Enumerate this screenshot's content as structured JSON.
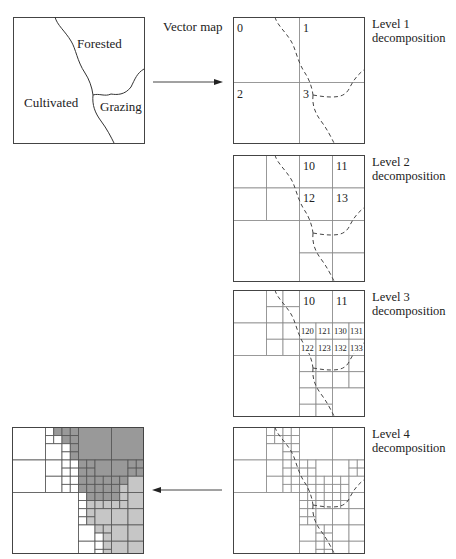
{
  "vector_map": {
    "caption": "Vector map",
    "regions": [
      {
        "name": "Forested",
        "x": 77,
        "y": 36
      },
      {
        "name": "Cultivated",
        "x": 24,
        "y": 95
      },
      {
        "name": "Grazing",
        "x": 100,
        "y": 99
      }
    ]
  },
  "levels": [
    {
      "caption_line1": "Level 1",
      "caption_line2": "decomposition",
      "quadrant_labels": [
        {
          "text": "0",
          "x": 4,
          "y": 4
        },
        {
          "text": "1",
          "x": 70,
          "y": 4
        },
        {
          "text": "2",
          "x": 4,
          "y": 70
        },
        {
          "text": "3",
          "x": 70,
          "y": 70
        }
      ]
    },
    {
      "caption_line1": "Level 2",
      "caption_line2": "decomposition",
      "quadrant_labels": [
        {
          "text": "10",
          "x": 70,
          "y": 4
        },
        {
          "text": "11",
          "x": 103,
          "y": 4
        },
        {
          "text": "12",
          "x": 70,
          "y": 36
        },
        {
          "text": "13",
          "x": 103,
          "y": 36
        }
      ]
    },
    {
      "caption_line1": "Level 3",
      "caption_line2": "decomposition",
      "quadrant_labels": [
        {
          "text": "10",
          "x": 70,
          "y": 4,
          "size": 12
        },
        {
          "text": "11",
          "x": 103,
          "y": 4,
          "size": 12
        },
        {
          "text": "120",
          "x": 68,
          "y": 36,
          "size": 8.5
        },
        {
          "text": "121",
          "x": 85,
          "y": 36,
          "size": 8.5
        },
        {
          "text": "130",
          "x": 101,
          "y": 36,
          "size": 8.5
        },
        {
          "text": "131",
          "x": 117,
          "y": 36,
          "size": 8.5
        },
        {
          "text": "122",
          "x": 68,
          "y": 53,
          "size": 8.5
        },
        {
          "text": "123",
          "x": 85,
          "y": 53,
          "size": 8.5
        },
        {
          "text": "132",
          "x": 101,
          "y": 53,
          "size": 8.5
        },
        {
          "text": "133",
          "x": 117,
          "y": 53,
          "size": 8.5
        }
      ]
    },
    {
      "caption_line1": "Level 4",
      "caption_line2": "decomposition",
      "quadrant_labels": []
    }
  ],
  "grids": {
    "level1": [
      [
        0,
        0,
        8
      ],
      [
        8,
        0,
        8
      ],
      [
        0,
        8,
        8
      ],
      [
        8,
        8,
        8
      ]
    ],
    "level2": [
      [
        0,
        0,
        4
      ],
      [
        4,
        0,
        4
      ],
      [
        0,
        4,
        4
      ],
      [
        4,
        4,
        4
      ],
      [
        8,
        0,
        4
      ],
      [
        12,
        0,
        4
      ],
      [
        8,
        4,
        4
      ],
      [
        12,
        4,
        4
      ],
      [
        0,
        8,
        8
      ],
      [
        8,
        8,
        4
      ],
      [
        12,
        8,
        4
      ],
      [
        8,
        12,
        4
      ],
      [
        12,
        12,
        4
      ]
    ],
    "level3": [
      [
        0,
        0,
        4
      ],
      [
        4,
        0,
        2
      ],
      [
        6,
        0,
        2
      ],
      [
        4,
        2,
        2
      ],
      [
        6,
        2,
        2
      ],
      [
        0,
        4,
        4
      ],
      [
        4,
        4,
        2
      ],
      [
        6,
        4,
        2
      ],
      [
        4,
        6,
        2
      ],
      [
        6,
        6,
        2
      ],
      [
        8,
        0,
        4
      ],
      [
        12,
        0,
        4
      ],
      [
        8,
        4,
        2
      ],
      [
        10,
        4,
        2
      ],
      [
        12,
        4,
        2
      ],
      [
        14,
        4,
        2
      ],
      [
        8,
        6,
        2
      ],
      [
        10,
        6,
        2
      ],
      [
        12,
        6,
        2
      ],
      [
        14,
        6,
        2
      ],
      [
        0,
        8,
        8
      ],
      [
        8,
        8,
        2
      ],
      [
        10,
        8,
        2
      ],
      [
        8,
        10,
        2
      ],
      [
        10,
        10,
        2
      ],
      [
        12,
        8,
        2
      ],
      [
        14,
        8,
        2
      ],
      [
        12,
        10,
        2
      ],
      [
        14,
        10,
        2
      ],
      [
        8,
        12,
        2
      ],
      [
        10,
        12,
        2
      ],
      [
        8,
        14,
        2
      ],
      [
        10,
        14,
        2
      ],
      [
        12,
        12,
        4
      ]
    ],
    "level4": [
      [
        0,
        0,
        4
      ],
      [
        4,
        0,
        1
      ],
      [
        5,
        0,
        1
      ],
      [
        4,
        1,
        1
      ],
      [
        5,
        1,
        1
      ],
      [
        6,
        0,
        1
      ],
      [
        7,
        0,
        1
      ],
      [
        6,
        1,
        1
      ],
      [
        7,
        1,
        1
      ],
      [
        4,
        2,
        2
      ],
      [
        6,
        2,
        1
      ],
      [
        7,
        2,
        1
      ],
      [
        6,
        3,
        1
      ],
      [
        7,
        3,
        1
      ],
      [
        0,
        4,
        4
      ],
      [
        4,
        4,
        2
      ],
      [
        6,
        4,
        1
      ],
      [
        7,
        4,
        1
      ],
      [
        6,
        5,
        1
      ],
      [
        7,
        5,
        1
      ],
      [
        4,
        6,
        2
      ],
      [
        6,
        6,
        1
      ],
      [
        7,
        6,
        1
      ],
      [
        6,
        7,
        1
      ],
      [
        7,
        7,
        1
      ],
      [
        8,
        0,
        4
      ],
      [
        12,
        0,
        4
      ],
      [
        8,
        4,
        1
      ],
      [
        9,
        4,
        1
      ],
      [
        8,
        5,
        1
      ],
      [
        9,
        5,
        1
      ],
      [
        10,
        4,
        2
      ],
      [
        12,
        4,
        2
      ],
      [
        14,
        4,
        1
      ],
      [
        15,
        4,
        1
      ],
      [
        14,
        5,
        1
      ],
      [
        15,
        5,
        1
      ],
      [
        8,
        6,
        1
      ],
      [
        9,
        6,
        1
      ],
      [
        8,
        7,
        1
      ],
      [
        9,
        7,
        1
      ],
      [
        10,
        6,
        1
      ],
      [
        11,
        6,
        1
      ],
      [
        10,
        7,
        1
      ],
      [
        11,
        7,
        1
      ],
      [
        12,
        6,
        1
      ],
      [
        13,
        6,
        1
      ],
      [
        12,
        7,
        1
      ],
      [
        13,
        7,
        1
      ],
      [
        14,
        6,
        2
      ],
      [
        0,
        8,
        8
      ],
      [
        8,
        8,
        1
      ],
      [
        9,
        8,
        1
      ],
      [
        8,
        9,
        1
      ],
      [
        9,
        9,
        1
      ],
      [
        10,
        8,
        1
      ],
      [
        11,
        8,
        1
      ],
      [
        10,
        9,
        1
      ],
      [
        11,
        9,
        1
      ],
      [
        12,
        8,
        1
      ],
      [
        13,
        8,
        1
      ],
      [
        12,
        9,
        1
      ],
      [
        13,
        9,
        1
      ],
      [
        14,
        8,
        2
      ],
      [
        8,
        10,
        1
      ],
      [
        9,
        10,
        1
      ],
      [
        8,
        11,
        1
      ],
      [
        9,
        11,
        1
      ],
      [
        10,
        10,
        2
      ],
      [
        12,
        10,
        2
      ],
      [
        14,
        10,
        2
      ],
      [
        8,
        12,
        2
      ],
      [
        10,
        12,
        1
      ],
      [
        11,
        12,
        1
      ],
      [
        10,
        13,
        1
      ],
      [
        11,
        13,
        1
      ],
      [
        8,
        14,
        2
      ],
      [
        10,
        14,
        1
      ],
      [
        11,
        14,
        1
      ],
      [
        10,
        15,
        1
      ],
      [
        11,
        15,
        1
      ],
      [
        12,
        12,
        2
      ],
      [
        14,
        12,
        2
      ],
      [
        12,
        14,
        2
      ],
      [
        14,
        14,
        2
      ]
    ]
  },
  "result_raster": {
    "colors": {
      "forested": "#999999",
      "grazing": "#c6c6c6",
      "cultivated": "#ffffff",
      "line": "#4a4a4a"
    },
    "cells": [
      [
        0,
        0,
        4,
        "cultivated"
      ],
      [
        4,
        0,
        1,
        "cultivated"
      ],
      [
        5,
        0,
        1,
        "forested"
      ],
      [
        4,
        1,
        1,
        "cultivated"
      ],
      [
        5,
        1,
        1,
        "cultivated"
      ],
      [
        6,
        0,
        1,
        "forested"
      ],
      [
        7,
        0,
        1,
        "forested"
      ],
      [
        6,
        1,
        1,
        "forested"
      ],
      [
        7,
        1,
        1,
        "forested"
      ],
      [
        4,
        2,
        2,
        "cultivated"
      ],
      [
        6,
        2,
        1,
        "cultivated"
      ],
      [
        7,
        2,
        1,
        "forested"
      ],
      [
        6,
        3,
        1,
        "cultivated"
      ],
      [
        7,
        3,
        1,
        "forested"
      ],
      [
        0,
        4,
        4,
        "cultivated"
      ],
      [
        4,
        4,
        2,
        "cultivated"
      ],
      [
        6,
        4,
        1,
        "cultivated"
      ],
      [
        7,
        4,
        1,
        "cultivated"
      ],
      [
        6,
        5,
        1,
        "cultivated"
      ],
      [
        7,
        5,
        1,
        "cultivated"
      ],
      [
        4,
        6,
        2,
        "cultivated"
      ],
      [
        6,
        6,
        1,
        "cultivated"
      ],
      [
        7,
        6,
        1,
        "cultivated"
      ],
      [
        6,
        7,
        1,
        "cultivated"
      ],
      [
        7,
        7,
        1,
        "cultivated"
      ],
      [
        8,
        0,
        4,
        "forested"
      ],
      [
        12,
        0,
        4,
        "forested"
      ],
      [
        8,
        4,
        1,
        "forested"
      ],
      [
        9,
        4,
        1,
        "forested"
      ],
      [
        8,
        5,
        1,
        "forested"
      ],
      [
        9,
        5,
        1,
        "forested"
      ],
      [
        10,
        4,
        2,
        "forested"
      ],
      [
        12,
        4,
        2,
        "forested"
      ],
      [
        14,
        4,
        1,
        "forested"
      ],
      [
        15,
        4,
        1,
        "forested"
      ],
      [
        14,
        5,
        1,
        "forested"
      ],
      [
        15,
        5,
        1,
        "forested"
      ],
      [
        8,
        6,
        1,
        "forested"
      ],
      [
        9,
        6,
        1,
        "forested"
      ],
      [
        8,
        7,
        1,
        "forested"
      ],
      [
        9,
        7,
        1,
        "forested"
      ],
      [
        10,
        6,
        1,
        "forested"
      ],
      [
        11,
        6,
        1,
        "forested"
      ],
      [
        10,
        7,
        1,
        "forested"
      ],
      [
        11,
        7,
        1,
        "forested"
      ],
      [
        12,
        6,
        1,
        "forested"
      ],
      [
        13,
        6,
        1,
        "forested"
      ],
      [
        12,
        7,
        1,
        "forested"
      ],
      [
        13,
        7,
        1,
        "grazing"
      ],
      [
        14,
        6,
        2,
        "grazing"
      ],
      [
        0,
        8,
        8,
        "cultivated"
      ],
      [
        8,
        8,
        1,
        "cultivated"
      ],
      [
        9,
        8,
        1,
        "forested"
      ],
      [
        8,
        9,
        1,
        "cultivated"
      ],
      [
        9,
        9,
        1,
        "grazing"
      ],
      [
        10,
        8,
        1,
        "forested"
      ],
      [
        11,
        8,
        1,
        "forested"
      ],
      [
        10,
        9,
        1,
        "grazing"
      ],
      [
        11,
        9,
        1,
        "grazing"
      ],
      [
        12,
        8,
        1,
        "forested"
      ],
      [
        13,
        8,
        1,
        "grazing"
      ],
      [
        12,
        9,
        1,
        "grazing"
      ],
      [
        13,
        9,
        1,
        "grazing"
      ],
      [
        14,
        8,
        2,
        "grazing"
      ],
      [
        8,
        10,
        1,
        "cultivated"
      ],
      [
        9,
        10,
        1,
        "grazing"
      ],
      [
        8,
        11,
        1,
        "cultivated"
      ],
      [
        9,
        11,
        1,
        "grazing"
      ],
      [
        10,
        10,
        2,
        "grazing"
      ],
      [
        12,
        10,
        2,
        "grazing"
      ],
      [
        14,
        10,
        2,
        "grazing"
      ],
      [
        8,
        12,
        2,
        "cultivated"
      ],
      [
        10,
        12,
        1,
        "grazing"
      ],
      [
        11,
        12,
        1,
        "grazing"
      ],
      [
        10,
        13,
        1,
        "cultivated"
      ],
      [
        11,
        13,
        1,
        "grazing"
      ],
      [
        8,
        14,
        2,
        "cultivated"
      ],
      [
        10,
        14,
        1,
        "cultivated"
      ],
      [
        11,
        14,
        1,
        "grazing"
      ],
      [
        10,
        15,
        1,
        "cultivated"
      ],
      [
        11,
        15,
        1,
        "grazing"
      ],
      [
        12,
        12,
        2,
        "grazing"
      ],
      [
        14,
        12,
        2,
        "grazing"
      ],
      [
        12,
        14,
        2,
        "grazing"
      ],
      [
        14,
        14,
        2,
        "grazing"
      ]
    ]
  },
  "arrows": {
    "forward": {
      "from": "vector-map",
      "to": "level-1"
    },
    "backward": {
      "from": "level-4",
      "to": "raster-result"
    }
  }
}
